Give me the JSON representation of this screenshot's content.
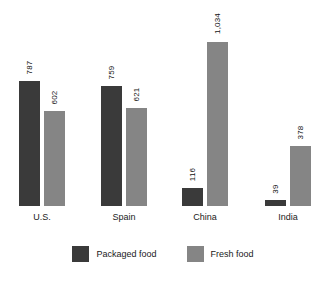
{
  "chart_data": {
    "type": "bar",
    "title": "",
    "subtitle": "",
    "xlabel": "",
    "ylabel": "",
    "ylim": [
      0,
      1034
    ],
    "grid": false,
    "legend_position": "bottom-center",
    "categories": [
      "U.S.",
      "Spain",
      "China",
      "India"
    ],
    "series": [
      {
        "name": "Packaged food",
        "color": "#3a3a3a",
        "values": [
          787,
          759,
          116,
          39
        ],
        "value_labels": [
          "787",
          "759",
          "116",
          "39"
        ]
      },
      {
        "name": "Fresh food",
        "color": "#858585",
        "values": [
          602,
          621,
          1034,
          378
        ],
        "value_labels": [
          "602",
          "621",
          "1,034",
          "378"
        ]
      }
    ]
  },
  "legend": {
    "items": [
      {
        "label": "Packaged food",
        "swatch_name": "legend-swatch-packaged-food"
      },
      {
        "label": "Fresh food",
        "swatch_name": "legend-swatch-fresh-food"
      }
    ]
  }
}
